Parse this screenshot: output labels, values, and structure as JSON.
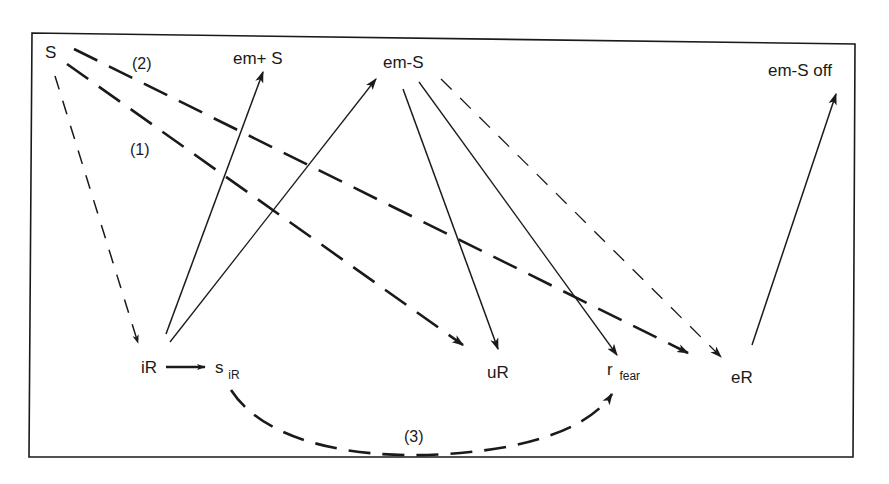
{
  "diagram": {
    "type": "flow diagram (stimulus-response paths)",
    "nodes": {
      "S": {
        "label": "S",
        "x": 45,
        "y": 58
      },
      "em_plus_S": {
        "label": "em+ S",
        "x": 233,
        "y": 64
      },
      "em_minus_S": {
        "label": "em-S",
        "x": 383,
        "y": 68
      },
      "em_minus_S_off": {
        "label": "em-S off",
        "x": 768,
        "y": 76
      },
      "iR": {
        "label": "iR",
        "x": 141,
        "y": 373
      },
      "s_iR": {
        "label": "s",
        "sub": "iR",
        "x": 215,
        "y": 375
      },
      "uR": {
        "label": "uR",
        "x": 487,
        "y": 378
      },
      "r_fear": {
        "label": "r",
        "sub": "fear",
        "x": 607,
        "y": 378
      },
      "eR": {
        "label": "eR",
        "x": 731,
        "y": 383
      }
    },
    "edge_labels": {
      "path1": "(1)",
      "path2": "(2)",
      "path3": "(3)"
    },
    "edges": [
      {
        "from": "S",
        "to": "iR",
        "style": "thin-dashed"
      },
      {
        "from": "S",
        "to": "uR",
        "style": "thick-dashed",
        "label": "(1)"
      },
      {
        "from": "S",
        "to": "eR",
        "style": "thick-dashed",
        "label": "(2)"
      },
      {
        "from": "iR",
        "to": "s_iR",
        "style": "solid-thick"
      },
      {
        "from": "iR",
        "to": "em_plus_S",
        "style": "solid"
      },
      {
        "from": "iR",
        "to": "em_minus_S",
        "style": "solid"
      },
      {
        "from": "em_minus_S",
        "to": "uR",
        "style": "solid"
      },
      {
        "from": "em_minus_S",
        "to": "r_fear",
        "style": "solid"
      },
      {
        "from": "em_minus_S",
        "to": "eR",
        "style": "thin-dashed"
      },
      {
        "from": "eR",
        "to": "em_minus_S_off",
        "style": "solid"
      },
      {
        "from": "s_iR",
        "to": "r_fear",
        "style": "thick-dashed-curve",
        "label": "(3)"
      }
    ],
    "colors": {
      "ink": "#1a1a1a",
      "background": "#ffffff"
    }
  }
}
